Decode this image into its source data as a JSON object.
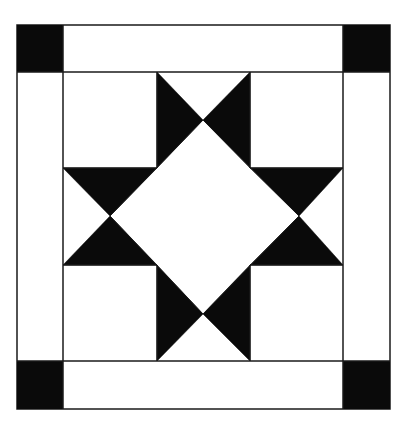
{
  "diagram": {
    "type": "quilt-block",
    "colors": {
      "background": "#ffffff",
      "fill_dark": "#0a0a0a",
      "line": "#1a1a1a"
    },
    "outer_frame": {
      "x": 17,
      "y": 25,
      "width": 373,
      "height": 384
    },
    "corner_squares": [
      {
        "name": "corner-square-top-left",
        "x": 17,
        "y": 25,
        "w": 46,
        "h": 47
      },
      {
        "name": "corner-square-top-right",
        "x": 343,
        "y": 25,
        "w": 47,
        "h": 47
      },
      {
        "name": "corner-square-bottom-left",
        "x": 17,
        "y": 361,
        "w": 46,
        "h": 48
      },
      {
        "name": "corner-square-bottom-right",
        "x": 343,
        "y": 361,
        "w": 47,
        "h": 48
      }
    ],
    "inner_grid": {
      "x_lines": [
        63,
        157,
        250,
        343
      ],
      "y_lines": [
        72,
        168,
        265,
        361
      ]
    },
    "center_diamond": {
      "points": [
        [
          203,
          120
        ],
        [
          299,
          216
        ],
        [
          203,
          314
        ],
        [
          110,
          216
        ]
      ]
    },
    "star_point_triangles": [
      {
        "name": "star-point-top-left",
        "points": [
          [
            157,
            72
          ],
          [
            203,
            120
          ],
          [
            157,
            168
          ]
        ]
      },
      {
        "name": "star-point-top-right",
        "points": [
          [
            250,
            72
          ],
          [
            203,
            120
          ],
          [
            250,
            168
          ]
        ]
      },
      {
        "name": "star-point-right-top",
        "points": [
          [
            250,
            168
          ],
          [
            299,
            216
          ],
          [
            343,
            168
          ]
        ]
      },
      {
        "name": "star-point-right-bottom",
        "points": [
          [
            250,
            265
          ],
          [
            299,
            216
          ],
          [
            343,
            265
          ]
        ]
      },
      {
        "name": "star-point-bottom-left",
        "points": [
          [
            157,
            265
          ],
          [
            203,
            314
          ],
          [
            157,
            361
          ]
        ]
      },
      {
        "name": "star-point-bottom-right",
        "points": [
          [
            250,
            265
          ],
          [
            203,
            314
          ],
          [
            250,
            361
          ]
        ]
      },
      {
        "name": "star-point-left-top",
        "points": [
          [
            63,
            168
          ],
          [
            110,
            216
          ],
          [
            157,
            168
          ]
        ]
      },
      {
        "name": "star-point-left-bottom",
        "points": [
          [
            63,
            265
          ],
          [
            110,
            216
          ],
          [
            157,
            265
          ]
        ]
      }
    ]
  }
}
